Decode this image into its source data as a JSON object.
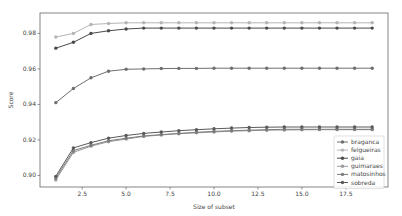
{
  "chart_data": {
    "type": "line",
    "title": "",
    "xlabel": "Size of subset",
    "ylabel": "Score",
    "xlim": [
      0.1,
      19.9
    ],
    "ylim": [
      0.8935,
      0.9915
    ],
    "xticks": [
      2.5,
      5.0,
      7.5,
      10.0,
      12.5,
      15.0,
      17.5
    ],
    "xtick_labels": [
      "2.5",
      "5.0",
      "7.5",
      "10.0",
      "12.5",
      "15.0",
      "17.5"
    ],
    "yticks": [
      0.9,
      0.92,
      0.94,
      0.96,
      0.98
    ],
    "ytick_labels": [
      "0.90",
      "0.92",
      "0.94",
      "0.96",
      "0.98"
    ],
    "grid": false,
    "legend_position": "lower right",
    "x": [
      1,
      2,
      3,
      4,
      5,
      6,
      7,
      8,
      9,
      10,
      11,
      12,
      13,
      14,
      15,
      16,
      17,
      18,
      19
    ],
    "series": [
      {
        "name": "braganca",
        "color": "#6e6e6e",
        "values": [
          0.941,
          0.949,
          0.955,
          0.9587,
          0.9598,
          0.96,
          0.9602,
          0.9603,
          0.9603,
          0.9604,
          0.9604,
          0.9604,
          0.9604,
          0.9604,
          0.9604,
          0.9604,
          0.9604,
          0.9604,
          0.9604
        ]
      },
      {
        "name": "felgueiras",
        "color": "#b4b4b4",
        "values": [
          0.978,
          0.98,
          0.985,
          0.9856,
          0.986,
          0.986,
          0.986,
          0.986,
          0.986,
          0.986,
          0.986,
          0.986,
          0.986,
          0.986,
          0.986,
          0.986,
          0.986,
          0.986,
          0.986
        ]
      },
      {
        "name": "gaia",
        "color": "#4a4a4a",
        "values": [
          0.9717,
          0.975,
          0.98,
          0.9815,
          0.9825,
          0.983,
          0.983,
          0.983,
          0.983,
          0.983,
          0.983,
          0.983,
          0.983,
          0.983,
          0.983,
          0.983,
          0.983,
          0.983,
          0.983
        ]
      },
      {
        "name": "guimaraes",
        "color": "#9a9a9a",
        "values": [
          0.8975,
          0.913,
          0.9165,
          0.919,
          0.9205,
          0.922,
          0.9228,
          0.9235,
          0.924,
          0.9245,
          0.925,
          0.9252,
          0.9255,
          0.9256,
          0.9257,
          0.9258,
          0.9258,
          0.9258,
          0.9258
        ]
      },
      {
        "name": "matosinhos",
        "color": "#7c7c7c",
        "values": [
          0.8985,
          0.914,
          0.917,
          0.9195,
          0.921,
          0.9222,
          0.923,
          0.9237,
          0.9243,
          0.9248,
          0.9252,
          0.9255,
          0.9258,
          0.926,
          0.926,
          0.926,
          0.926,
          0.926,
          0.926
        ]
      },
      {
        "name": "sobreda",
        "color": "#5a5a5a",
        "values": [
          0.8995,
          0.9155,
          0.9185,
          0.921,
          0.9225,
          0.9237,
          0.9245,
          0.9252,
          0.9258,
          0.9263,
          0.9267,
          0.927,
          0.9272,
          0.9273,
          0.9273,
          0.9273,
          0.9273,
          0.9273,
          0.9273
        ]
      }
    ]
  },
  "plot": {
    "left": 40,
    "top": 13,
    "right": 388,
    "bottom": 187
  }
}
